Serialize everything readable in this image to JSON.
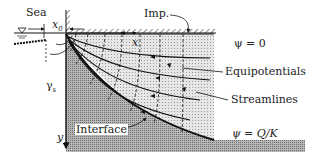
{
  "diagram": {
    "labels": {
      "sea": "Sea",
      "x0": "x",
      "x0_sub": "0",
      "imp": "Imp.",
      "x": "x",
      "psi0": "ψ = 0",
      "equipotentials": "Equipotentials",
      "streamlines": "Streamlines",
      "gamma": "γ",
      "gamma_sub": "s",
      "y": "y",
      "interface": "Interface",
      "psiQK": "ψ = Q/K"
    },
    "colors": {
      "line": "#111111",
      "fresh_fill": "#d8d8d8",
      "salt_fill": "#a9a9a9",
      "background": "#ffffff"
    }
  }
}
